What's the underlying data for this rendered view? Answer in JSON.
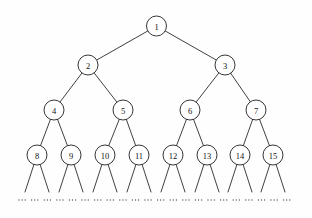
{
  "diagram": {
    "type": "binary-tree",
    "canvas": {
      "width": 312,
      "height": 218,
      "background": "#fefefe"
    },
    "style": {
      "node_fill": "#ffffff",
      "node_stroke": "#1f1f1f",
      "edge_stroke": "#2b2b2b",
      "label_color": "#111111",
      "node_radius": 10,
      "ellipsis_color": "#555555"
    },
    "levels": [
      {
        "level": 1,
        "y": 26,
        "labels": [
          "1"
        ]
      },
      {
        "level": 2,
        "y": 65,
        "labels": [
          "2",
          "3"
        ]
      },
      {
        "level": 3,
        "y": 110,
        "labels": [
          "4",
          "5",
          "6",
          "7"
        ]
      },
      {
        "level": 4,
        "y": 155,
        "labels": [
          "8",
          "9",
          "10",
          "11",
          "12",
          "13",
          "14",
          "15"
        ]
      }
    ],
    "nodes": [
      {
        "id": 1,
        "label": "1",
        "x": 156.5,
        "y": 26,
        "level": 1,
        "parent": null
      },
      {
        "id": 2,
        "label": "2",
        "x": 88,
        "y": 65,
        "level": 2,
        "parent": 1
      },
      {
        "id": 3,
        "label": "3",
        "x": 225,
        "y": 65,
        "level": 2,
        "parent": 1
      },
      {
        "id": 4,
        "label": "4",
        "x": 54,
        "y": 110,
        "level": 3,
        "parent": 2
      },
      {
        "id": 5,
        "label": "5",
        "x": 123,
        "y": 110,
        "level": 3,
        "parent": 2
      },
      {
        "id": 6,
        "label": "6",
        "x": 190,
        "y": 110,
        "level": 3,
        "parent": 3
      },
      {
        "id": 7,
        "label": "7",
        "x": 256,
        "y": 110,
        "level": 3,
        "parent": 3
      },
      {
        "id": 8,
        "label": "8",
        "x": 37,
        "y": 155,
        "level": 4,
        "parent": 4
      },
      {
        "id": 9,
        "label": "9",
        "x": 71,
        "y": 155,
        "level": 4,
        "parent": 4
      },
      {
        "id": 10,
        "label": "10",
        "x": 105,
        "y": 155,
        "level": 4,
        "parent": 5
      },
      {
        "id": 11,
        "label": "11",
        "x": 139,
        "y": 155,
        "level": 4,
        "parent": 5
      },
      {
        "id": 12,
        "label": "12",
        "x": 173,
        "y": 155,
        "level": 4,
        "parent": 6
      },
      {
        "id": 13,
        "label": "13",
        "x": 207,
        "y": 155,
        "level": 4,
        "parent": 6
      },
      {
        "id": 14,
        "label": "14",
        "x": 240,
        "y": 155,
        "level": 4,
        "parent": 7
      },
      {
        "id": 15,
        "label": "15",
        "x": 273,
        "y": 155,
        "level": 4,
        "parent": 7
      }
    ],
    "edges": [
      {
        "from": 1,
        "to": 2
      },
      {
        "from": 1,
        "to": 3
      },
      {
        "from": 2,
        "to": 4
      },
      {
        "from": 2,
        "to": 5
      },
      {
        "from": 3,
        "to": 6
      },
      {
        "from": 3,
        "to": 7
      },
      {
        "from": 4,
        "to": 8
      },
      {
        "from": 4,
        "to": 9
      },
      {
        "from": 5,
        "to": 10
      },
      {
        "from": 5,
        "to": 11
      },
      {
        "from": 6,
        "to": 12
      },
      {
        "from": 6,
        "to": 13
      },
      {
        "from": 7,
        "to": 14
      },
      {
        "from": 7,
        "to": 15
      }
    ],
    "leaf_stubs": {
      "description": "two short edges descending from each level-4 node indicating continuation",
      "from_node_ids": [
        8,
        9,
        10,
        11,
        12,
        13,
        14,
        15
      ],
      "dx": 12,
      "end_y": 192
    },
    "ellipsis_row": {
      "symbol": "...",
      "y": 200,
      "group_count": 22,
      "start_x": 19,
      "spacing": 12.6,
      "dot_radius": 0.65,
      "dot_gap": 3.1
    }
  }
}
